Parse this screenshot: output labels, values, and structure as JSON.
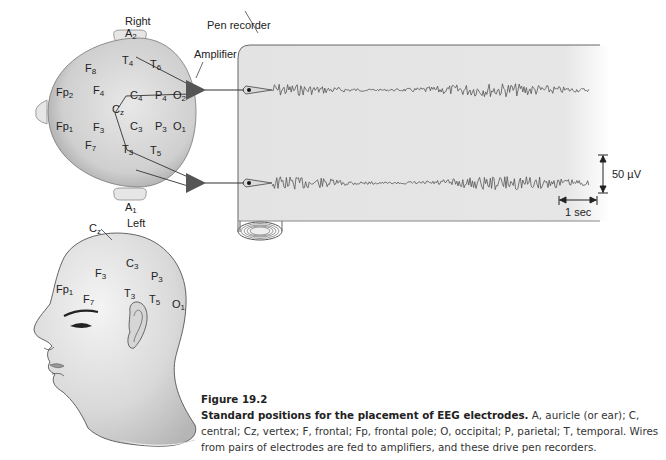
{
  "figure": {
    "number_label": "Figure 19.2",
    "title": "Standard positions for the placement of EEG electrodes.",
    "body": " A, auricle (or ear); C, central; Cz, vertex; F, frontal; Fp, frontal pole; O, occipital; P, parietal; T, temporal. Wires from pairs of electrodes are fed to amplifiers, and these drive pen recorders."
  },
  "labels": {
    "right": "Right",
    "left": "Left",
    "amplifier": "Amplifier",
    "pen_recorder": "Pen recorder",
    "voltage_scale": "50 µV",
    "time_scale": "1 sec"
  },
  "top_view_electrodes": [
    {
      "base": "A",
      "sub": "2",
      "x": 125,
      "y": 28
    },
    {
      "base": "F",
      "sub": "8",
      "x": 85,
      "y": 63
    },
    {
      "base": "T",
      "sub": "4",
      "x": 122,
      "y": 55
    },
    {
      "base": "T",
      "sub": "6",
      "x": 150,
      "y": 59
    },
    {
      "base": "Fp",
      "sub": "2",
      "x": 56,
      "y": 87
    },
    {
      "base": "F",
      "sub": "4",
      "x": 93,
      "y": 85
    },
    {
      "base": "C",
      "sub": "4",
      "x": 130,
      "y": 90
    },
    {
      "base": "P",
      "sub": "4",
      "x": 155,
      "y": 90
    },
    {
      "base": "O",
      "sub": "2",
      "x": 173,
      "y": 90
    },
    {
      "base": "C",
      "sub": "z",
      "x": 112,
      "y": 104
    },
    {
      "base": "C",
      "sub": "3",
      "x": 130,
      "y": 121
    },
    {
      "base": "P",
      "sub": "3",
      "x": 155,
      "y": 121
    },
    {
      "base": "O",
      "sub": "1",
      "x": 173,
      "y": 121
    },
    {
      "base": "Fp",
      "sub": "1",
      "x": 56,
      "y": 121
    },
    {
      "base": "F",
      "sub": "3",
      "x": 93,
      "y": 122
    },
    {
      "base": "F",
      "sub": "7",
      "x": 85,
      "y": 140
    },
    {
      "base": "T",
      "sub": "3",
      "x": 122,
      "y": 144
    },
    {
      "base": "T",
      "sub": "5",
      "x": 150,
      "y": 145
    },
    {
      "base": "A",
      "sub": "1",
      "x": 125,
      "y": 202
    }
  ],
  "side_view_electrodes": [
    {
      "base": "C",
      "sub": "z",
      "x": 89,
      "y": 223
    },
    {
      "base": "C",
      "sub": "3",
      "x": 126,
      "y": 258
    },
    {
      "base": "F",
      "sub": "3",
      "x": 95,
      "y": 268
    },
    {
      "base": "P",
      "sub": "3",
      "x": 151,
      "y": 271
    },
    {
      "base": "Fp",
      "sub": "1",
      "x": 56,
      "y": 284
    },
    {
      "base": "T",
      "sub": "3",
      "x": 124,
      "y": 288
    },
    {
      "base": "F",
      "sub": "7",
      "x": 83,
      "y": 294
    },
    {
      "base": "T",
      "sub": "5",
      "x": 149,
      "y": 294
    },
    {
      "base": "O",
      "sub": "1",
      "x": 172,
      "y": 299
    }
  ],
  "chart_data": {
    "type": "line",
    "series": [
      {
        "name": "Channel 1 (T4–C4/T6 pair, right)",
        "baseline_y_px": 90
      },
      {
        "name": "Channel 2 (Cz–T3/T5 pair, left)",
        "baseline_y_px": 183
      }
    ],
    "scale_bars": {
      "voltage": "50 µV",
      "time": "1 sec"
    },
    "grid": false
  }
}
